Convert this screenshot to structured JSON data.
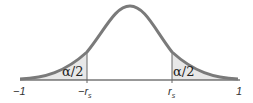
{
  "diagram": {
    "type": "bell-curve-two-tailed",
    "colors": {
      "curve": "#7a7a7a",
      "shade": "#e6e6e6",
      "axis": "#333333"
    },
    "regions": [
      {
        "label": "α/2",
        "side": "left"
      },
      {
        "label": "α/2",
        "side": "right"
      }
    ],
    "ticks": [
      {
        "label": "−1"
      },
      {
        "label": "−r",
        "sub": "s"
      },
      {
        "label": "r",
        "sub": "s"
      },
      {
        "label": "1"
      }
    ]
  }
}
